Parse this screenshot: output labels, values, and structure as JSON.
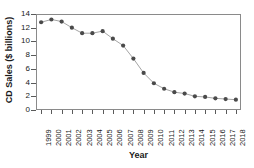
{
  "chart_data": {
    "type": "line",
    "title": "",
    "xlabel": "Year",
    "ylabel": "CD Sales ($ billions)",
    "categories": [
      "1999",
      "2000",
      "2001",
      "2002",
      "2003",
      "2004",
      "2005",
      "2006",
      "2007",
      "2008",
      "2009",
      "2010",
      "2011",
      "2012",
      "2013",
      "2014",
      "2015",
      "2016",
      "2017",
      "2018"
    ],
    "values": [
      12.8,
      13.2,
      12.9,
      12.0,
      11.2,
      11.2,
      11.5,
      10.4,
      9.4,
      7.5,
      5.4,
      3.9,
      3.1,
      2.6,
      2.4,
      2.0,
      1.9,
      1.7,
      1.6,
      1.5
    ],
    "ylim": [
      0,
      14
    ],
    "yticks": [
      0,
      2,
      4,
      6,
      8,
      10,
      12,
      14
    ],
    "ytick_labels": [
      "0",
      "2",
      "4",
      "6",
      "8",
      "10",
      "12",
      "14"
    ],
    "grid": false,
    "legend": "none",
    "marker": "circle",
    "marker_color": "#4a4a4a",
    "line_color": "#9a9a9a",
    "frame_color": "#8a8a8a"
  }
}
